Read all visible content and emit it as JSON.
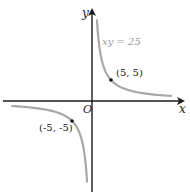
{
  "chart_data": {
    "type": "line",
    "title": "",
    "xlabel": "x",
    "ylabel": "y",
    "origin_label": "O",
    "equation_label": "xy = 25",
    "series": [
      {
        "name": "xy = 25 (first quadrant branch)",
        "color": "#a8a8a8",
        "points": [
          [
            1.3,
            19.2
          ],
          [
            2,
            12.5
          ],
          [
            3,
            8.33
          ],
          [
            4,
            6.25
          ],
          [
            5,
            5
          ],
          [
            7,
            3.57
          ],
          [
            10,
            2.5
          ],
          [
            15,
            1.67
          ],
          [
            20.8,
            1.2
          ]
        ]
      },
      {
        "name": "xy = 25 (third quadrant branch)",
        "color": "#a8a8a8",
        "points": [
          [
            -21,
            -1.19
          ],
          [
            -15,
            -1.67
          ],
          [
            -10,
            -2.5
          ],
          [
            -7,
            -3.57
          ],
          [
            -5,
            -5
          ],
          [
            -4,
            -6.25
          ],
          [
            -3,
            -8.33
          ],
          [
            -2,
            -12.5
          ],
          [
            -1.3,
            -19.2
          ]
        ]
      }
    ],
    "marked_points": [
      {
        "x": 5,
        "y": 5,
        "label": "(5, 5)"
      },
      {
        "x": -5,
        "y": -5,
        "label": "(-5, -5)"
      }
    ],
    "grid": false,
    "legend": "none"
  },
  "labels": {
    "x_axis": "x",
    "y_axis": "y",
    "origin": "O",
    "equation": "xy = 25",
    "point_pos": "(5, 5)",
    "point_neg": "(-5, -5)"
  },
  "colors": {
    "axis": "#1a1a1a",
    "curve": "#a8a8a8",
    "equation_text": "#9a9a9a"
  }
}
